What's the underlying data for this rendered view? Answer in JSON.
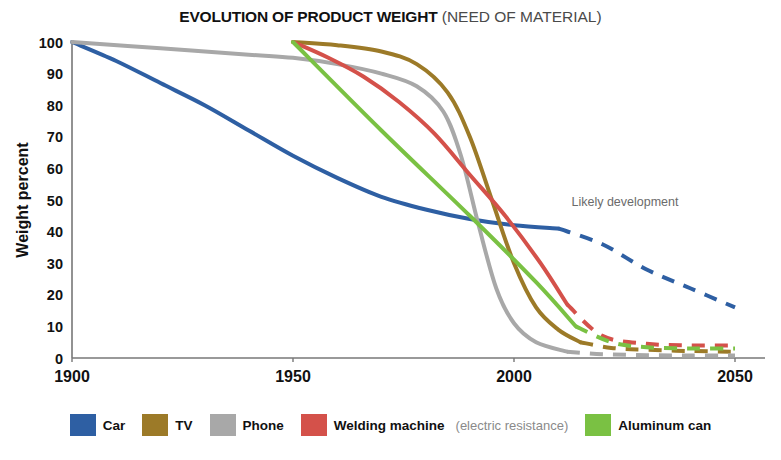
{
  "chart_data": {
    "type": "line",
    "title": "EVOLUTION OF PRODUCT WEIGHT",
    "title_suffix": "(NEED OF MATERIAL)",
    "xlabel": "",
    "ylabel": "Weight percent",
    "xlim": [
      1900,
      2050
    ],
    "ylim": [
      0,
      100
    ],
    "grid": false,
    "legend_position": "bottom",
    "xticks": [
      1900,
      1950,
      2000,
      2050
    ],
    "yticks": [
      0,
      10,
      20,
      30,
      40,
      50,
      60,
      70,
      80,
      90,
      100
    ],
    "annotations": [
      {
        "text": "Likely development",
        "x": 2013,
        "y": 48
      }
    ],
    "series": [
      {
        "name": "Car",
        "color": "#2e5fa3",
        "solid": [
          {
            "x": 1900,
            "y": 100
          },
          {
            "x": 1910,
            "y": 94
          },
          {
            "x": 1920,
            "y": 87
          },
          {
            "x": 1930,
            "y": 80
          },
          {
            "x": 1940,
            "y": 72
          },
          {
            "x": 1950,
            "y": 64
          },
          {
            "x": 1960,
            "y": 57
          },
          {
            "x": 1970,
            "y": 51
          },
          {
            "x": 1980,
            "y": 47
          },
          {
            "x": 1990,
            "y": 44
          },
          {
            "x": 2000,
            "y": 42
          },
          {
            "x": 2010,
            "y": 41
          }
        ],
        "dashed": [
          {
            "x": 2010,
            "y": 41
          },
          {
            "x": 2020,
            "y": 36
          },
          {
            "x": 2030,
            "y": 28
          },
          {
            "x": 2040,
            "y": 22
          },
          {
            "x": 2050,
            "y": 16
          }
        ]
      },
      {
        "name": "TV",
        "color": "#9c7a28",
        "solid": [
          {
            "x": 1950,
            "y": 100
          },
          {
            "x": 1960,
            "y": 99
          },
          {
            "x": 1970,
            "y": 97
          },
          {
            "x": 1978,
            "y": 93
          },
          {
            "x": 1985,
            "y": 84
          },
          {
            "x": 1990,
            "y": 70
          },
          {
            "x": 1995,
            "y": 50
          },
          {
            "x": 2000,
            "y": 30
          },
          {
            "x": 2005,
            "y": 16
          },
          {
            "x": 2010,
            "y": 9
          },
          {
            "x": 2015,
            "y": 5
          }
        ],
        "dashed": [
          {
            "x": 2015,
            "y": 5
          },
          {
            "x": 2022,
            "y": 3.2
          },
          {
            "x": 2030,
            "y": 2.6
          },
          {
            "x": 2040,
            "y": 2.2
          },
          {
            "x": 2050,
            "y": 2.0
          }
        ]
      },
      {
        "name": "Phone",
        "color": "#a8a8a8",
        "solid": [
          {
            "x": 1900,
            "y": 100
          },
          {
            "x": 1920,
            "y": 98
          },
          {
            "x": 1940,
            "y": 96
          },
          {
            "x": 1950,
            "y": 95
          },
          {
            "x": 1960,
            "y": 93
          },
          {
            "x": 1970,
            "y": 90
          },
          {
            "x": 1978,
            "y": 86
          },
          {
            "x": 1984,
            "y": 78
          },
          {
            "x": 1988,
            "y": 64
          },
          {
            "x": 1992,
            "y": 42
          },
          {
            "x": 1996,
            "y": 22
          },
          {
            "x": 2000,
            "y": 11
          },
          {
            "x": 2005,
            "y": 5
          },
          {
            "x": 2012,
            "y": 2
          }
        ],
        "dashed": [
          {
            "x": 2012,
            "y": 2
          },
          {
            "x": 2020,
            "y": 1.2
          },
          {
            "x": 2030,
            "y": 0.9
          },
          {
            "x": 2040,
            "y": 0.8
          },
          {
            "x": 2050,
            "y": 0.8
          }
        ]
      },
      {
        "name": "Welding machine",
        "note": "(electric resistance)",
        "color": "#d4514a",
        "solid": [
          {
            "x": 1950,
            "y": 100
          },
          {
            "x": 1958,
            "y": 95
          },
          {
            "x": 1966,
            "y": 89
          },
          {
            "x": 1974,
            "y": 81
          },
          {
            "x": 1982,
            "y": 71
          },
          {
            "x": 1990,
            "y": 58
          },
          {
            "x": 1998,
            "y": 45
          },
          {
            "x": 2006,
            "y": 30
          },
          {
            "x": 2012,
            "y": 17
          }
        ],
        "dashed": [
          {
            "x": 2012,
            "y": 17
          },
          {
            "x": 2020,
            "y": 7
          },
          {
            "x": 2030,
            "y": 4.5
          },
          {
            "x": 2040,
            "y": 4.0
          },
          {
            "x": 2050,
            "y": 4.0
          }
        ]
      },
      {
        "name": "Aluminum can",
        "color": "#7ac143",
        "solid": [
          {
            "x": 1950,
            "y": 100
          },
          {
            "x": 1970,
            "y": 72
          },
          {
            "x": 1990,
            "y": 45
          },
          {
            "x": 2005,
            "y": 24
          },
          {
            "x": 2014,
            "y": 10
          }
        ],
        "dashed": [
          {
            "x": 2014,
            "y": 10
          },
          {
            "x": 2022,
            "y": 5
          },
          {
            "x": 2030,
            "y": 3.4
          },
          {
            "x": 2040,
            "y": 3.0
          },
          {
            "x": 2050,
            "y": 3.0
          }
        ]
      }
    ]
  },
  "legend": {
    "items": [
      {
        "label": "Car",
        "note": "",
        "color": "#2e5fa3"
      },
      {
        "label": "TV",
        "note": "",
        "color": "#9c7a28"
      },
      {
        "label": "Phone",
        "note": "",
        "color": "#a8a8a8"
      },
      {
        "label": "Welding machine",
        "note": "(electric resistance)",
        "color": "#d4514a"
      },
      {
        "label": "Aluminum can",
        "note": "",
        "color": "#7ac143"
      }
    ]
  }
}
